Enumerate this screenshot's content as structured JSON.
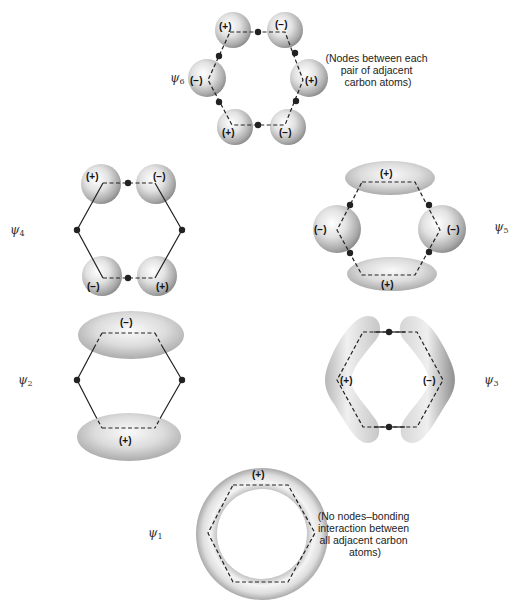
{
  "figure": {
    "orbitals": [
      {
        "id": "psi6",
        "label": "ψ",
        "subscript": "6",
        "signs": [
          "(+)",
          "(−)",
          "(−)",
          "(+)",
          "(+)",
          "(−)"
        ],
        "note": [
          "(Nodes between each",
          "pair of adjacent",
          "carbon atoms)"
        ]
      },
      {
        "id": "psi4",
        "label": "ψ",
        "subscript": "4",
        "signs": [
          "(+)",
          "(−)",
          "(−)",
          "(+)"
        ]
      },
      {
        "id": "psi5",
        "label": "ψ",
        "subscript": "5",
        "signs": [
          "(+)",
          "(−)",
          "(−)",
          "(+)"
        ]
      },
      {
        "id": "psi2",
        "label": "ψ",
        "subscript": "2",
        "signs": [
          "(−)",
          "(+)"
        ]
      },
      {
        "id": "psi3",
        "label": "ψ",
        "subscript": "3",
        "signs": [
          "(+)",
          "(−)"
        ]
      },
      {
        "id": "psi1",
        "label": "ψ",
        "subscript": "1",
        "signs": [
          "(+)"
        ],
        "note": [
          "(No nodes–bonding",
          "interaction between",
          "all adjacent carbon",
          "atoms)"
        ]
      }
    ]
  }
}
